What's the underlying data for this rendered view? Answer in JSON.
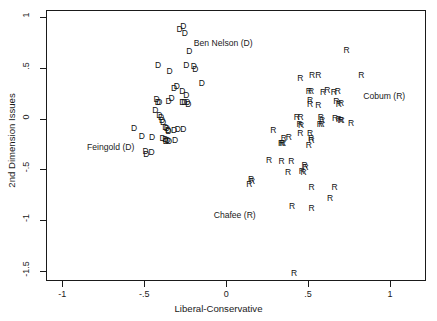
{
  "chart_data": {
    "type": "scatter",
    "title": "",
    "xlabel": "Liberal-Conservative",
    "ylabel": "2nd Dimension Issues",
    "xlim": [
      -1.1,
      1.22
    ],
    "ylim": [
      -1.6,
      1.07
    ],
    "xticks": [
      -1,
      -0.5,
      0,
      0.5,
      1
    ],
    "xticklabels": [
      "-1",
      "-.5",
      "0",
      ".5",
      "1"
    ],
    "yticks": [
      1,
      0.5,
      0,
      -0.5,
      -1,
      -1.5
    ],
    "yticklabels": [
      "1",
      ".5",
      "0",
      "-.5",
      "-1",
      "-1.5"
    ],
    "grid": false,
    "legend": null,
    "marker_style": "text-glyph",
    "series": [
      {
        "name": "Democrats",
        "marker": "D",
        "color": "#111111",
        "points": [
          [
            -0.285,
            0.88
          ],
          [
            -0.262,
            0.915
          ],
          [
            -0.252,
            0.845
          ],
          [
            -0.225,
            0.665
          ],
          [
            -0.243,
            0.525
          ],
          [
            -0.198,
            0.515
          ],
          [
            -0.188,
            0.487
          ],
          [
            -0.415,
            0.528
          ],
          [
            -0.345,
            0.465
          ],
          [
            -0.148,
            0.355
          ],
          [
            -0.318,
            0.305
          ],
          [
            -0.302,
            0.318
          ],
          [
            -0.268,
            0.268
          ],
          [
            -0.243,
            0.232
          ],
          [
            -0.333,
            0.205
          ],
          [
            -0.352,
            0.172
          ],
          [
            -0.425,
            0.192
          ],
          [
            -0.418,
            0.162
          ],
          [
            -0.408,
            0.165
          ],
          [
            -0.268,
            0.168
          ],
          [
            -0.255,
            0.165
          ],
          [
            -0.237,
            0.162
          ],
          [
            -0.231,
            0.145
          ],
          [
            -0.432,
            0.082
          ],
          [
            -0.408,
            0.038
          ],
          [
            -0.398,
            0.012
          ],
          [
            -0.392,
            -0.012
          ],
          [
            -0.385,
            -0.038
          ],
          [
            -0.372,
            -0.082
          ],
          [
            -0.362,
            -0.092
          ],
          [
            -0.355,
            -0.108
          ],
          [
            -0.352,
            -0.118
          ],
          [
            -0.318,
            -0.108
          ],
          [
            -0.295,
            -0.102
          ],
          [
            -0.262,
            -0.098
          ],
          [
            -0.562,
            -0.092
          ],
          [
            -0.515,
            -0.175
          ],
          [
            -0.452,
            -0.182
          ],
          [
            -0.388,
            -0.188
          ],
          [
            -0.372,
            -0.205
          ],
          [
            -0.368,
            -0.222
          ],
          [
            -0.358,
            -0.215
          ],
          [
            -0.348,
            -0.225
          ],
          [
            -0.312,
            -0.212
          ],
          [
            -0.492,
            -0.322
          ],
          [
            -0.488,
            -0.352
          ],
          [
            -0.455,
            -0.332
          ]
        ]
      },
      {
        "name": "Republicans",
        "marker": "R",
        "color": "#111111",
        "points": [
          [
            0.735,
            0.672
          ],
          [
            0.825,
            0.432
          ],
          [
            0.525,
            0.428
          ],
          [
            0.562,
            0.432
          ],
          [
            0.452,
            0.398
          ],
          [
            0.505,
            0.275
          ],
          [
            0.518,
            0.272
          ],
          [
            0.592,
            0.262
          ],
          [
            0.618,
            0.282
          ],
          [
            0.658,
            0.262
          ],
          [
            0.682,
            0.268
          ],
          [
            0.512,
            0.185
          ],
          [
            0.672,
            0.172
          ],
          [
            0.688,
            0.148
          ],
          [
            0.702,
            0.152
          ],
          [
            0.512,
            0.142
          ],
          [
            0.562,
            0.138
          ],
          [
            0.432,
            0.015
          ],
          [
            0.455,
            0.015
          ],
          [
            0.578,
            0.012
          ],
          [
            0.585,
            -0.012
          ],
          [
            0.665,
            0.005
          ],
          [
            0.688,
            -0.008
          ],
          [
            0.698,
            -0.012
          ],
          [
            0.705,
            -0.015
          ],
          [
            0.762,
            -0.048
          ],
          [
            0.448,
            -0.052
          ],
          [
            0.458,
            -0.062
          ],
          [
            0.572,
            -0.055
          ],
          [
            0.582,
            -0.058
          ],
          [
            0.288,
            -0.112
          ],
          [
            0.452,
            -0.138
          ],
          [
            0.512,
            -0.145
          ],
          [
            0.352,
            -0.192
          ],
          [
            0.382,
            -0.178
          ],
          [
            0.518,
            -0.192
          ],
          [
            0.522,
            -0.215
          ],
          [
            0.335,
            -0.238
          ],
          [
            0.342,
            -0.242
          ],
          [
            0.348,
            -0.238
          ],
          [
            0.505,
            -0.262
          ],
          [
            0.262,
            -0.412
          ],
          [
            0.338,
            -0.415
          ],
          [
            0.398,
            -0.418
          ],
          [
            0.478,
            -0.462
          ],
          [
            0.485,
            -0.478
          ],
          [
            0.378,
            -0.528
          ],
          [
            0.462,
            -0.512
          ],
          [
            0.472,
            -0.525
          ],
          [
            0.152,
            -0.592
          ],
          [
            0.158,
            -0.612
          ],
          [
            0.142,
            -0.645
          ],
          [
            0.522,
            -0.678
          ],
          [
            0.662,
            -0.672
          ],
          [
            0.635,
            -0.782
          ],
          [
            0.402,
            -0.862
          ],
          [
            0.522,
            -0.878
          ],
          [
            0.415,
            -1.518
          ]
        ]
      }
    ],
    "annotations": [
      {
        "text": "Ben Nelson (D)",
        "x": -0.018,
        "y": 0.745
      },
      {
        "text": "Cobum (R)",
        "x": 0.965,
        "y": 0.225
      },
      {
        "text": "Feingold (D)",
        "x": -0.705,
        "y": -0.282
      },
      {
        "text": "Chafee (R)",
        "x": 0.052,
        "y": -0.952
      }
    ]
  }
}
